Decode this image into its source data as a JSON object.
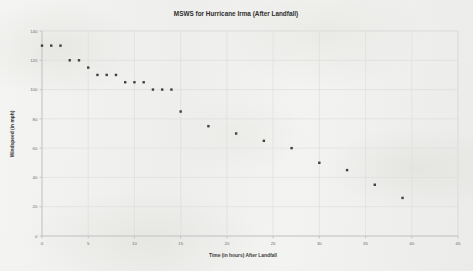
{
  "chart_data": {
    "type": "scatter",
    "title": "MSWS for Hurricane Irma (After Landfall)",
    "xlabel": "Time (in hours) After Landfall",
    "ylabel": "Windspeed (in mph)",
    "xlim": [
      0,
      45
    ],
    "ylim": [
      0,
      140
    ],
    "xticks": [
      0,
      5,
      10,
      15,
      20,
      25,
      30,
      35,
      40,
      45
    ],
    "yticks": [
      0,
      20,
      40,
      60,
      80,
      100,
      120,
      140
    ],
    "grid": true,
    "legend": null,
    "series": [
      {
        "name": "MSWS",
        "marker": "square",
        "color": "#3f3f3f",
        "x": [
          0,
          1,
          2,
          3,
          4,
          5,
          6,
          7,
          8,
          9,
          10,
          11,
          12,
          13,
          14,
          15,
          18,
          21,
          24,
          27,
          30,
          33,
          36,
          39
        ],
        "y": [
          130,
          130,
          130,
          120,
          120,
          115,
          110,
          110,
          110,
          105,
          105,
          105,
          100,
          100,
          100,
          85,
          75,
          70,
          65,
          60,
          50,
          45,
          35,
          26
        ]
      }
    ]
  },
  "figure": {
    "background_color": "#f2f2f0",
    "grid_color": "#dcdcdc",
    "axis_color": "#bdbdbd",
    "text_color": "#3b3b3b"
  }
}
